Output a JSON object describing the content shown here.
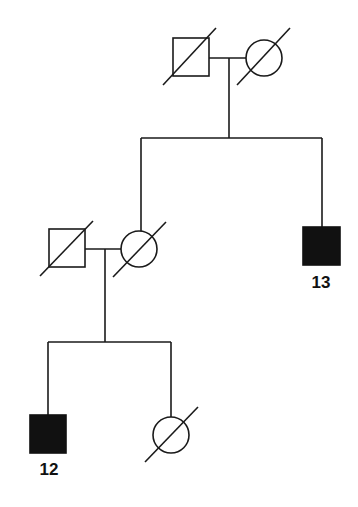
{
  "diagram": {
    "type": "pedigree",
    "generations": [
      {
        "level": "I",
        "individuals": [
          {
            "id": "I-1",
            "sex": "male",
            "affected": false,
            "deceased": true,
            "label": ""
          },
          {
            "id": "I-2",
            "sex": "female",
            "affected": false,
            "deceased": true,
            "label": ""
          }
        ]
      },
      {
        "level": "II",
        "individuals": [
          {
            "id": "II-spouse",
            "sex": "male",
            "affected": false,
            "deceased": true,
            "label": ""
          },
          {
            "id": "II-1",
            "sex": "female",
            "affected": false,
            "deceased": true,
            "label": ""
          },
          {
            "id": "II-2",
            "sex": "male",
            "affected": true,
            "deceased": false,
            "label": "13"
          }
        ]
      },
      {
        "level": "III",
        "individuals": [
          {
            "id": "III-1",
            "sex": "male",
            "affected": true,
            "deceased": false,
            "label": "12"
          },
          {
            "id": "III-2",
            "sex": "female",
            "affected": false,
            "deceased": true,
            "label": ""
          }
        ]
      }
    ],
    "labels": {
      "proband_13": "13",
      "proband_12": "12"
    },
    "colors": {
      "stroke": "#1a1a1a",
      "affected_fill": "#111111",
      "background": "#ffffff"
    }
  }
}
